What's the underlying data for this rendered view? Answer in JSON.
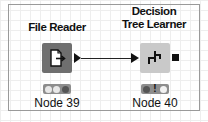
{
  "workflow": {
    "nodes": [
      {
        "title": "File Reader",
        "label": "Node 39",
        "icon": "file-export-icon",
        "icon_bg": "#6f6f6f",
        "output_port": "triangle",
        "status": [
          "#e8e8e8",
          "#e8e8e8",
          "#555555"
        ]
      },
      {
        "title_line1": "Decision",
        "title_line2": "Tree Learner",
        "label": "Node 40",
        "icon": "decision-tree-icon",
        "icon_bg": "#c9c9c9",
        "input_port": "triangle",
        "output_port": "square",
        "status": [
          "#555555",
          "warning",
          "#f2f2f2"
        ]
      }
    ],
    "connections": [
      {
        "from": "Node 39",
        "to": "Node 40"
      }
    ],
    "colors": {
      "grid": "#eeeeee",
      "frame": "#9a9a9a",
      "status_bar": "#8d8d8d"
    }
  }
}
